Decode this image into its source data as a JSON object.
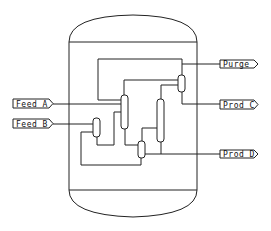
{
  "diagram": {
    "type": "process-flow-diagram",
    "colors": {
      "line": "#222222",
      "background": "#ffffff"
    },
    "inlets": [
      {
        "id": "feed-a",
        "label": "Feed A"
      },
      {
        "id": "feed-b",
        "label": "Feed B"
      }
    ],
    "outlets": [
      {
        "id": "purge",
        "label": "Purge"
      },
      {
        "id": "prod-c",
        "label": "Prod C"
      },
      {
        "id": "prod-d",
        "label": "Prod D"
      }
    ],
    "equipment": [
      {
        "id": "boundary-vessel",
        "kind": "vessel-outline"
      },
      {
        "id": "column-1",
        "kind": "column"
      },
      {
        "id": "column-2",
        "kind": "column"
      },
      {
        "id": "separator-top",
        "kind": "drum"
      },
      {
        "id": "drum-feed-b",
        "kind": "drum"
      },
      {
        "id": "drum-bottom",
        "kind": "drum"
      }
    ]
  }
}
